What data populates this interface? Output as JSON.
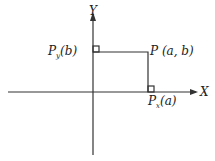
{
  "axes": {
    "x_label": "X",
    "y_label": "Y"
  },
  "points": {
    "p": "P (a, b)",
    "py": "P",
    "py_sub": "y",
    "py_arg": "(b)",
    "px": "P",
    "px_sub": "x",
    "px_arg": "(a)"
  },
  "colors": {
    "line": "#333333"
  }
}
